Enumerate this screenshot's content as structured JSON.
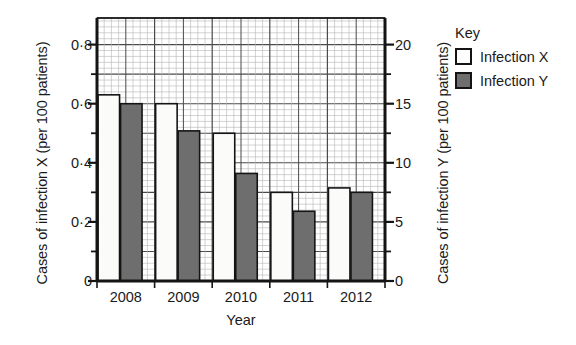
{
  "chart_data": {
    "type": "bar",
    "title": "",
    "xlabel": "Year",
    "categories": [
      "2008",
      "2009",
      "2010",
      "2011",
      "2012"
    ],
    "series": [
      {
        "name": "Infection X",
        "axis": "left",
        "color": "#ffffff",
        "values": [
          0.63,
          0.6,
          0.5,
          0.3,
          0.315
        ]
      },
      {
        "name": "Infection Y",
        "axis": "right",
        "color": "#6e6e6e",
        "values": [
          15.0,
          12.7,
          9.1,
          5.9,
          7.5
        ]
      }
    ],
    "left_axis": {
      "label": "Cases of infection X (per 100 patients)",
      "ticks": [
        "0",
        "0·2",
        "0·4",
        "0·6",
        "0·8"
      ],
      "tick_values": [
        0,
        0.2,
        0.4,
        0.6,
        0.8
      ],
      "lim": [
        0,
        0.89
      ]
    },
    "right_axis": {
      "label": "Cases of infection Y (per 100 patients)",
      "ticks": [
        "0",
        "5",
        "10",
        "15",
        "20"
      ],
      "tick_values": [
        0,
        5,
        10,
        15,
        20
      ],
      "lim": [
        0,
        22.25
      ]
    },
    "grid": "graph-paper minor and major gridlines",
    "legend_position": "right-outside"
  },
  "legend": {
    "title": "Key",
    "items": [
      {
        "label": "Infection X",
        "color": "#ffffff"
      },
      {
        "label": "Infection Y",
        "color": "#6e6e6e"
      }
    ]
  }
}
